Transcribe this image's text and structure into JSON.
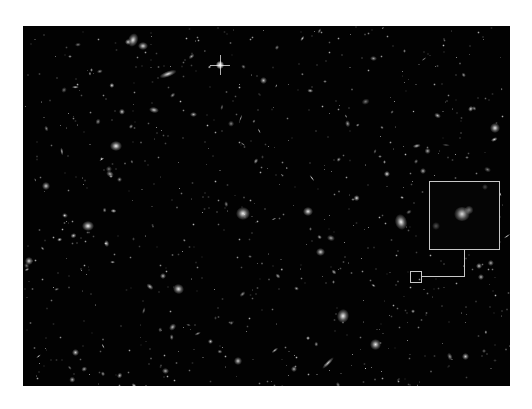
{
  "image": {
    "subject": "deep field of distant galaxies",
    "background_color": "#020202",
    "frame_color": "#ffffff",
    "annotation_color": "#c8c8c8"
  },
  "field_bounds": {
    "x": 23,
    "y": 26,
    "width": 487,
    "height": 360
  },
  "inset": {
    "zoom_box": {
      "x": 429,
      "y": 181,
      "width": 71,
      "height": 69
    },
    "marker_box": {
      "x": 410,
      "y": 271,
      "width": 12,
      "height": 12
    },
    "connector": {
      "vertical_x": 464,
      "y_from": 249,
      "y_to": 277,
      "horizontal_x_from": 421,
      "horizontal_x_to": 464
    }
  },
  "star": {
    "x": 220,
    "y": 65,
    "label": "foreground star with diffraction spikes"
  }
}
